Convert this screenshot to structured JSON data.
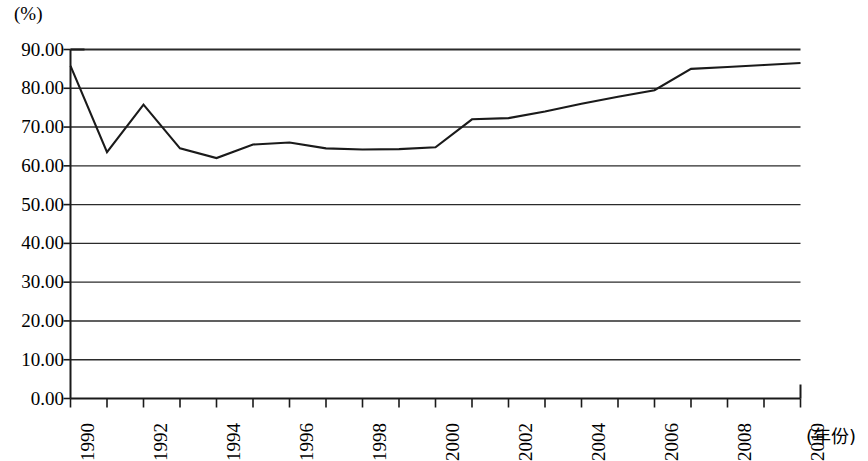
{
  "chart_data": {
    "type": "line",
    "title": "",
    "subtitle": "",
    "xlabel": "(年份)",
    "ylabel": "(%)",
    "unit_label": "(%)",
    "x": [
      1990,
      1991,
      1992,
      1993,
      1994,
      1995,
      1996,
      1997,
      1998,
      1999,
      2000,
      2001,
      2002,
      2003,
      2004,
      2005,
      2006,
      2007,
      2008,
      2009,
      2010
    ],
    "values": [
      85.8,
      63.5,
      75.8,
      64.5,
      62.0,
      65.5,
      66.0,
      64.5,
      64.2,
      64.3,
      64.8,
      72.0,
      72.3,
      74.0,
      76.0,
      77.8,
      79.5,
      85.0,
      85.5,
      86.0,
      86.5
    ],
    "series": [
      {
        "name": "",
        "values": [
          85.8,
          63.5,
          75.8,
          64.5,
          62.0,
          65.5,
          66.0,
          64.5,
          64.2,
          64.3,
          64.8,
          72.0,
          72.3,
          74.0,
          76.0,
          77.8,
          79.5,
          85.0,
          85.5,
          86.0,
          86.5
        ]
      }
    ],
    "xlim": [
      1990,
      2010
    ],
    "ylim": [
      0.0,
      90.0
    ],
    "ytick_values": [
      0.0,
      10.0,
      20.0,
      30.0,
      40.0,
      50.0,
      60.0,
      70.0,
      80.0,
      90.0
    ],
    "ytick_labels": [
      "0.00",
      "10.00",
      "20.00",
      "30.00",
      "40.00",
      "50.00",
      "60.00",
      "70.00",
      "80.00",
      "90.00"
    ],
    "xtick_values": [
      1990,
      1991,
      1992,
      1993,
      1994,
      1995,
      1996,
      1997,
      1998,
      1999,
      2000,
      2001,
      2002,
      2003,
      2004,
      2005,
      2006,
      2007,
      2008,
      2009,
      2010
    ],
    "xtick_labels": [
      "1990",
      "",
      "1992",
      "",
      "1994",
      "",
      "1996",
      "",
      "1998",
      "",
      "2000",
      "",
      "2002",
      "",
      "2004",
      "",
      "2006",
      "",
      "2008",
      "",
      "2010"
    ],
    "grid": true,
    "grid_axis": "y",
    "legend": false,
    "legend_position": "none",
    "line_color": "#1a1a1a",
    "grid_color": "#2b2b2b",
    "frame_color": "#1a1a1a",
    "background_color": "#ffffff",
    "annotations": []
  },
  "axis": {
    "unit_label": "(%)",
    "x_title": "(年份)"
  }
}
